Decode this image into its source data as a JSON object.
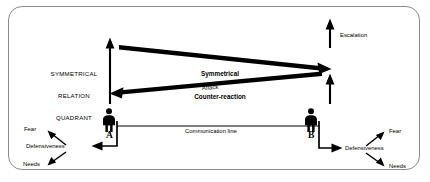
{
  "diagram": {
    "frame_color": "#8a8a8a",
    "ink_color": "#000000",
    "quadrant_label": "SYMMETRICAL\nRELATION\nQUADRANT",
    "quadrant_label_lines": [
      "SYMMETRICAL",
      "RELATION",
      "QUADRANT"
    ],
    "escalation_label": "Escalation",
    "counter_reaction_label_lines": [
      "Symmetrical",
      "Counter-reaction"
    ],
    "attack_label": "Attack",
    "communication_line_label": "Communication line",
    "actors": [
      {
        "id": "A",
        "letter": "A",
        "icon": "person-icon",
        "outcomes": [
          {
            "label": "Fear",
            "icon": "arrow-up-left-icon"
          },
          {
            "label": "Defensiveness",
            "icon": "arrow-left-icon"
          },
          {
            "label": "Needs",
            "icon": "arrow-down-left-icon"
          }
        ]
      },
      {
        "id": "B",
        "letter": "B",
        "icon": "person-icon",
        "outcomes": [
          {
            "label": "Fear",
            "icon": "arrow-up-right-icon"
          },
          {
            "label": "Defensiveness",
            "icon": "arrow-right-icon"
          },
          {
            "label": "Needs",
            "icon": "arrow-down-right-icon"
          }
        ]
      }
    ],
    "arrows": [
      {
        "name": "escalation-arrow-a",
        "direction": "up"
      },
      {
        "name": "escalation-arrow-b",
        "direction": "up"
      },
      {
        "name": "counter-reaction-arrow",
        "direction": "left-to-right"
      },
      {
        "name": "attack-arrow",
        "direction": "right-to-left"
      }
    ]
  }
}
